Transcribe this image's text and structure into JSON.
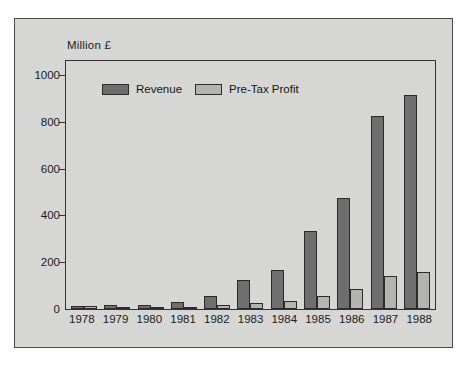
{
  "chart_data": {
    "type": "bar",
    "title": "",
    "subtitle": "",
    "unit_label": "Million £",
    "xlabel": "",
    "ylabel": "",
    "categories": [
      "1978",
      "1979",
      "1980",
      "1981",
      "1982",
      "1983",
      "1984",
      "1985",
      "1986",
      "1987",
      "1988"
    ],
    "series": [
      {
        "name": "Revenue",
        "color": "#6e6e6e",
        "values": [
          14,
          16,
          18,
          30,
          55,
          122,
          168,
          332,
          475,
          825,
          915
        ]
      },
      {
        "name": "Pre-Tax Profit",
        "color": "#b3b3b1",
        "values": [
          13,
          7,
          7,
          9,
          16,
          27,
          33,
          55,
          87,
          140,
          158
        ]
      }
    ],
    "ylim": [
      0,
      1060
    ],
    "yticks": [
      0,
      200,
      400,
      600,
      800,
      1000
    ],
    "ytick_labels": [
      "0",
      "200",
      "400",
      "600",
      "800",
      "1000"
    ],
    "grid": false,
    "legend_position": "top-left-inside",
    "panel_background": "#d6d6d4",
    "axis_color": "#33332f"
  }
}
